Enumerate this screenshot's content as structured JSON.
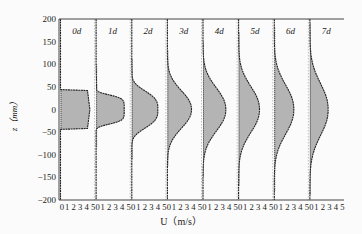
{
  "chart_data": {
    "type": "area",
    "title": "",
    "xlabel": "U (m/s)",
    "ylabel": "z (mm)",
    "ylim": [
      -200,
      200
    ],
    "yticks": [
      200,
      150,
      100,
      50,
      0,
      -50,
      -100,
      -150,
      -200
    ],
    "xticks_per_panel": [
      0,
      1,
      2,
      3,
      4,
      5
    ],
    "xlim_per_panel": [
      0,
      5
    ],
    "grid": false,
    "legend": null,
    "panels": [
      {
        "label": "0d",
        "peak_U": 4.5,
        "upper_edge_z": 42,
        "lower_edge_z": -42,
        "tail_top_z": 45,
        "tail_bottom_z": -45,
        "shape": "plug"
      },
      {
        "label": "1d",
        "peak_U": 4.3,
        "upper_edge_z": 40,
        "lower_edge_z": -40,
        "tail_top_z": 100,
        "tail_bottom_z": -85,
        "shape": "flattened"
      },
      {
        "label": "2d",
        "peak_U": 4.0,
        "upper_edge_z": 55,
        "lower_edge_z": -55,
        "tail_top_z": 110,
        "tail_bottom_z": -110,
        "shape": "top-hat-gaussian"
      },
      {
        "label": "3d",
        "peak_U": 3.7,
        "upper_edge_z": 65,
        "lower_edge_z": -65,
        "tail_top_z": 130,
        "tail_bottom_z": -125,
        "shape": "gaussian"
      },
      {
        "label": "4d",
        "peak_U": 3.5,
        "upper_edge_z": 75,
        "lower_edge_z": -75,
        "tail_top_z": 150,
        "tail_bottom_z": -150,
        "shape": "gaussian"
      },
      {
        "label": "5d",
        "peak_U": 3.2,
        "upper_edge_z": 80,
        "lower_edge_z": -80,
        "tail_top_z": 170,
        "tail_bottom_z": -170,
        "shape": "gaussian"
      },
      {
        "label": "6d",
        "peak_U": 3.0,
        "upper_edge_z": 85,
        "lower_edge_z": -85,
        "tail_top_z": 180,
        "tail_bottom_z": -180,
        "shape": "gaussian"
      },
      {
        "label": "7d",
        "peak_U": 2.8,
        "upper_edge_z": 90,
        "lower_edge_z": -90,
        "tail_top_z": 190,
        "tail_bottom_z": -190,
        "shape": "gaussian"
      }
    ]
  },
  "labels": {
    "xlabel": "U（m/s）",
    "ylabel": "z（mm）"
  }
}
